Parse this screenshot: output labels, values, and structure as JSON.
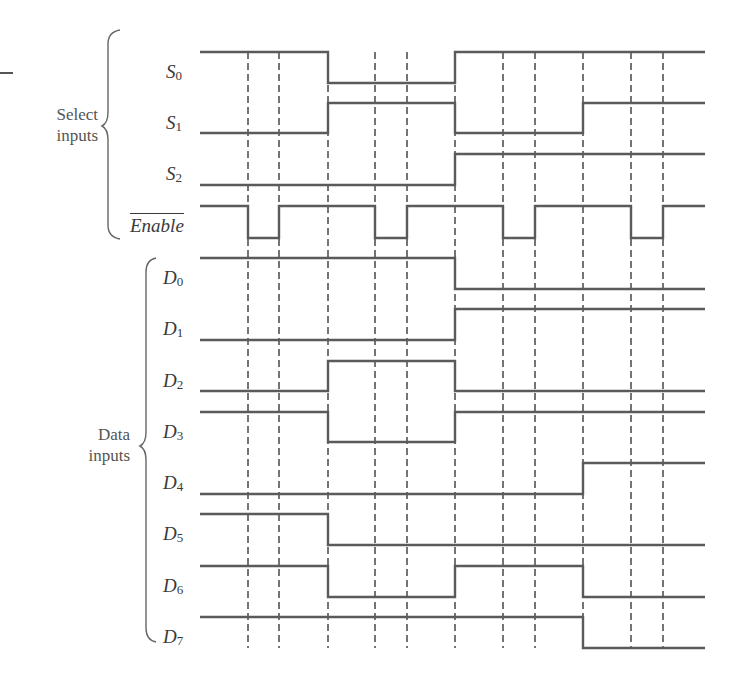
{
  "groups": {
    "select": {
      "line1": "Select",
      "line2": "inputs"
    },
    "data": {
      "line1": "Data",
      "line2": "inputs"
    }
  },
  "signals": [
    {
      "id": "S0",
      "base": "S",
      "sub": "0",
      "overbar": false,
      "y_high": 52,
      "y_low": 83,
      "label_y": 62
    },
    {
      "id": "S1",
      "base": "S",
      "sub": "1",
      "overbar": false,
      "y_high": 103,
      "y_low": 133,
      "label_y": 113
    },
    {
      "id": "S2",
      "base": "S",
      "sub": "2",
      "overbar": false,
      "y_high": 154,
      "y_low": 185,
      "label_y": 164
    },
    {
      "id": "Enable",
      "base": "Enable",
      "sub": "",
      "overbar": true,
      "y_high": 206,
      "y_low": 238,
      "label_y": 220
    },
    {
      "id": "D0",
      "base": "D",
      "sub": "0",
      "overbar": false,
      "y_high": 258,
      "y_low": 289,
      "label_y": 268
    },
    {
      "id": "D1",
      "base": "D",
      "sub": "1",
      "overbar": false,
      "y_high": 309,
      "y_low": 340,
      "label_y": 319
    },
    {
      "id": "D2",
      "base": "D",
      "sub": "2",
      "overbar": false,
      "y_high": 361,
      "y_low": 391,
      "label_y": 371
    },
    {
      "id": "D3",
      "base": "D",
      "sub": "3",
      "overbar": false,
      "y_high": 412,
      "y_low": 442,
      "label_y": 422
    },
    {
      "id": "D4",
      "base": "D",
      "sub": "4",
      "overbar": false,
      "y_high": 463,
      "y_low": 494,
      "label_y": 473
    },
    {
      "id": "D5",
      "base": "D",
      "sub": "5",
      "overbar": false,
      "y_high": 514,
      "y_low": 545,
      "label_y": 524
    },
    {
      "id": "D6",
      "base": "D",
      "sub": "6",
      "overbar": false,
      "y_high": 566,
      "y_low": 597,
      "label_y": 576
    },
    {
      "id": "D7",
      "base": "D",
      "sub": "7",
      "overbar": false,
      "y_high": 617,
      "y_low": 648,
      "label_y": 627
    }
  ],
  "timing": {
    "x_start": 200,
    "x_end": 705,
    "dashed_lines_x": [
      248,
      279,
      328,
      375,
      407,
      455,
      503,
      535,
      583,
      631,
      663
    ],
    "dash_top": 52,
    "dash_bottom": 648
  },
  "waveforms": {
    "S0": [
      [
        200,
        1
      ],
      [
        328,
        0
      ],
      [
        455,
        1
      ]
    ],
    "S1": [
      [
        200,
        0
      ],
      [
        328,
        1
      ],
      [
        455,
        0
      ],
      [
        583,
        1
      ]
    ],
    "S2": [
      [
        200,
        0
      ],
      [
        455,
        1
      ]
    ],
    "Enable": [
      [
        200,
        1
      ],
      [
        248,
        0
      ],
      [
        279,
        1
      ],
      [
        375,
        0
      ],
      [
        407,
        1
      ],
      [
        503,
        0
      ],
      [
        535,
        1
      ],
      [
        631,
        0
      ],
      [
        663,
        1
      ]
    ],
    "D0": [
      [
        200,
        1
      ],
      [
        455,
        0
      ]
    ],
    "D1": [
      [
        200,
        0
      ],
      [
        455,
        1
      ]
    ],
    "D2": [
      [
        200,
        0
      ],
      [
        328,
        1
      ],
      [
        455,
        0
      ]
    ],
    "D3": [
      [
        200,
        1
      ],
      [
        328,
        0
      ],
      [
        455,
        1
      ]
    ],
    "D4": [
      [
        200,
        0
      ],
      [
        583,
        1
      ]
    ],
    "D5": [
      [
        200,
        1
      ],
      [
        328,
        0
      ]
    ],
    "D6": [
      [
        200,
        1
      ],
      [
        328,
        0
      ],
      [
        455,
        1
      ],
      [
        583,
        0
      ]
    ],
    "D7": [
      [
        200,
        1
      ],
      [
        583,
        0
      ]
    ]
  },
  "colors": {
    "waveform": "#5a5a5a",
    "dashed": "#3a3a3a",
    "brace": "#666666"
  }
}
